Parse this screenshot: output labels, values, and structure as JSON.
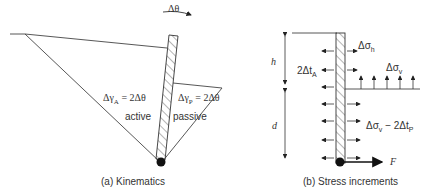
{
  "panel_a": {
    "caption": "(a) Kinematics",
    "rotation_label": "Δθ",
    "active": {
      "strain_label": "ΔγA = 2Δθ",
      "sym": "Δγ",
      "sub": "A",
      "eq": " = 2Δθ",
      "region_label": "active"
    },
    "passive": {
      "strain_label": "ΔγP = 2Δθ",
      "sym": "Δγ",
      "sub": "P",
      "eq": " = 2Δθ",
      "region_label": "passive"
    }
  },
  "panel_b": {
    "caption": "(b) Stress increments",
    "h_label": "h",
    "d_label": "d",
    "active_shear": {
      "pre": "2Δt",
      "sub": "A"
    },
    "horizontal_stress": {
      "pre": "Δσ",
      "sub": "h"
    },
    "vertical_stress": {
      "pre": "Δσ",
      "sub": "v"
    },
    "passive_stress": {
      "pre": "Δσ",
      "sub": "v",
      "mid": " − 2Δt",
      "sub2": "P"
    },
    "force_label": "F"
  }
}
